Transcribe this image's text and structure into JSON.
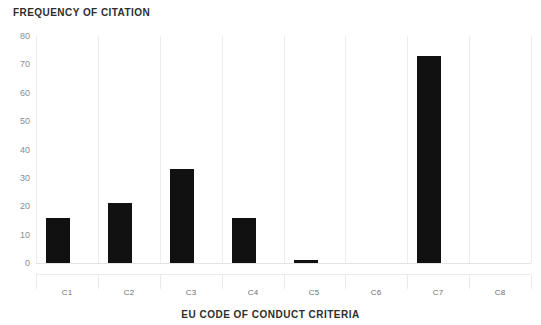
{
  "chart_data": {
    "type": "bar",
    "title": "",
    "xlabel": "EU CODE OF CONDUCT CRITERIA",
    "ylabel": "FREQUENCY OF CITATION",
    "categories": [
      "C1",
      "C2",
      "C3",
      "C4",
      "C5",
      "C6",
      "C7",
      "C8"
    ],
    "values": [
      16,
      21,
      33,
      16,
      1,
      0,
      73,
      0
    ],
    "ylim": [
      0,
      80
    ],
    "yticks": [
      0,
      10,
      20,
      30,
      40,
      50,
      60,
      70,
      80
    ],
    "ytick_labels": [
      "0",
      "10",
      "20",
      "30",
      "40",
      "50",
      "60",
      "70",
      "80"
    ],
    "grid": "vertical-only",
    "legend": "none",
    "series": [
      {
        "name": "Frequency of citation",
        "values": [
          16,
          21,
          33,
          16,
          1,
          0,
          73,
          0
        ],
        "color": "#111111"
      }
    ],
    "colors": {
      "bar": "#111111",
      "gridline": "#ededed",
      "axis_line": "#e4e4e4",
      "tick_text": "#8c8c8c",
      "title_text": "#2e2e2e",
      "background": "#ffffff"
    }
  }
}
